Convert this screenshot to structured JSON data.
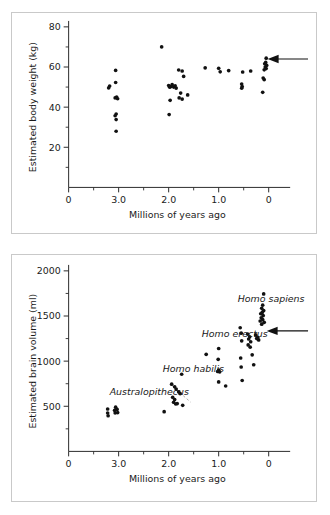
{
  "figure": {
    "background_color": "#ffffff",
    "panel_border_color": "#c9c9c9",
    "point_color": "#111111",
    "axis_color": "#2b2b2b"
  },
  "chart_data": [
    {
      "type": "scatter",
      "id": "body-weight",
      "title": "",
      "xlabel": "Millions of years ago",
      "ylabel": "Estimated body weight (kg)",
      "xlim": [
        4.0,
        -0.35
      ],
      "ylim": [
        0,
        80
      ],
      "x_ticks": [
        4.0,
        3.0,
        2.0,
        1.0,
        0
      ],
      "x_tick_labels": [
        "0",
        "3.0",
        "2.0",
        "1.0",
        "0"
      ],
      "x_minor_ticks": [
        3.5,
        2.5,
        1.5,
        0.5
      ],
      "y_ticks": [
        20,
        40,
        60,
        80
      ],
      "y_tick_labels": [
        "20",
        "40",
        "60",
        "80"
      ],
      "y_minor_ticks": [
        10,
        30,
        50,
        70
      ],
      "grid": false,
      "legend": "none",
      "annotations": [
        {
          "kind": "arrow",
          "label": "",
          "points_to_x": 0.02,
          "points_to_y": 64,
          "direction": "left"
        }
      ],
      "points": [
        {
          "x": 3.18,
          "y": 50.5
        },
        {
          "x": 3.2,
          "y": 49.6
        },
        {
          "x": 3.06,
          "y": 58.3
        },
        {
          "x": 3.06,
          "y": 52.3
        },
        {
          "x": 3.04,
          "y": 45.0
        },
        {
          "x": 3.02,
          "y": 44.2
        },
        {
          "x": 3.07,
          "y": 44.6
        },
        {
          "x": 3.05,
          "y": 36.6
        },
        {
          "x": 3.07,
          "y": 35.7
        },
        {
          "x": 3.05,
          "y": 33.8
        },
        {
          "x": 3.05,
          "y": 28.0
        },
        {
          "x": 2.14,
          "y": 70.0
        },
        {
          "x": 2.0,
          "y": 50.8
        },
        {
          "x": 1.98,
          "y": 49.9
        },
        {
          "x": 1.96,
          "y": 50.2
        },
        {
          "x": 1.93,
          "y": 51.2
        },
        {
          "x": 1.9,
          "y": 50.0
        },
        {
          "x": 1.87,
          "y": 50.6
        },
        {
          "x": 1.85,
          "y": 49.5
        },
        {
          "x": 1.97,
          "y": 43.4
        },
        {
          "x": 1.99,
          "y": 36.3
        },
        {
          "x": 1.8,
          "y": 58.5
        },
        {
          "x": 1.73,
          "y": 58.0
        },
        {
          "x": 1.7,
          "y": 55.3
        },
        {
          "x": 1.76,
          "y": 47.0
        },
        {
          "x": 1.79,
          "y": 44.6
        },
        {
          "x": 1.73,
          "y": 44.0
        },
        {
          "x": 1.62,
          "y": 46.1
        },
        {
          "x": 1.27,
          "y": 59.6
        },
        {
          "x": 1.0,
          "y": 59.4
        },
        {
          "x": 0.97,
          "y": 57.6
        },
        {
          "x": 0.8,
          "y": 58.2
        },
        {
          "x": 0.52,
          "y": 57.5
        },
        {
          "x": 0.36,
          "y": 58.0
        },
        {
          "x": 0.54,
          "y": 51.5
        },
        {
          "x": 0.53,
          "y": 50.3
        },
        {
          "x": 0.54,
          "y": 49.4
        },
        {
          "x": 0.05,
          "y": 64.4
        },
        {
          "x": 0.06,
          "y": 62.3
        },
        {
          "x": 0.08,
          "y": 61.6
        },
        {
          "x": 0.04,
          "y": 60.8
        },
        {
          "x": 0.07,
          "y": 60.0
        },
        {
          "x": 0.05,
          "y": 59.2
        },
        {
          "x": 0.09,
          "y": 58.6
        },
        {
          "x": 0.11,
          "y": 54.5
        },
        {
          "x": 0.09,
          "y": 53.7
        },
        {
          "x": 0.12,
          "y": 47.4
        }
      ]
    },
    {
      "type": "scatter",
      "id": "brain-volume",
      "title": "",
      "xlabel": "Millions of years ago",
      "ylabel": "Estimated brain volume (ml)",
      "xlim": [
        4.0,
        -0.35
      ],
      "ylim": [
        0,
        2000
      ],
      "x_ticks": [
        4.0,
        3.0,
        2.0,
        1.0,
        0
      ],
      "x_tick_labels": [
        "0",
        "3.0",
        "2.0",
        "1.0",
        "0"
      ],
      "x_minor_ticks": [
        3.5,
        2.5,
        1.5,
        0.5
      ],
      "y_ticks": [
        500,
        1000,
        1500,
        2000
      ],
      "y_tick_labels": [
        "500",
        "1000",
        "1500",
        "2000"
      ],
      "y_minor_ticks": [
        250,
        750,
        1250,
        1750
      ],
      "grid": false,
      "legend": "none",
      "species_labels": [
        {
          "text": "Australopithecus",
          "x": 3.18,
          "y": 620
        },
        {
          "text": "Homo habilis",
          "x": 2.12,
          "y": 880
        },
        {
          "text": "Homo erectus",
          "x": 1.34,
          "y": 1265
        },
        {
          "text": "Homo sapiens",
          "x": 0.62,
          "y": 1655
        }
      ],
      "annotations": [
        {
          "kind": "arrow",
          "label": "",
          "points_to_x": 0.04,
          "points_to_y": 1335,
          "direction": "left"
        },
        {
          "kind": "dashed-divider",
          "from_x": 1.92,
          "from_y": 720,
          "to_x": 1.56,
          "to_y": 545
        }
      ],
      "points": [
        {
          "x": 3.22,
          "y": 470
        },
        {
          "x": 3.22,
          "y": 425
        },
        {
          "x": 3.21,
          "y": 395
        },
        {
          "x": 3.06,
          "y": 490
        },
        {
          "x": 3.03,
          "y": 465
        },
        {
          "x": 3.08,
          "y": 455
        },
        {
          "x": 3.02,
          "y": 430
        },
        {
          "x": 3.07,
          "y": 425
        },
        {
          "x": 2.09,
          "y": 440
        },
        {
          "x": 1.94,
          "y": 745
        },
        {
          "x": 1.88,
          "y": 715
        },
        {
          "x": 1.85,
          "y": 690
        },
        {
          "x": 1.92,
          "y": 600
        },
        {
          "x": 1.88,
          "y": 575
        },
        {
          "x": 1.9,
          "y": 545
        },
        {
          "x": 1.86,
          "y": 525
        },
        {
          "x": 1.83,
          "y": 530
        },
        {
          "x": 1.8,
          "y": 660
        },
        {
          "x": 1.77,
          "y": 640
        },
        {
          "x": 1.74,
          "y": 855
        },
        {
          "x": 1.72,
          "y": 510
        },
        {
          "x": 1.25,
          "y": 1075
        },
        {
          "x": 1.0,
          "y": 1140
        },
        {
          "x": 1.01,
          "y": 1020
        },
        {
          "x": 1.0,
          "y": 900
        },
        {
          "x": 1.02,
          "y": 885
        },
        {
          "x": 0.98,
          "y": 880
        },
        {
          "x": 1.0,
          "y": 770
        },
        {
          "x": 0.86,
          "y": 725
        },
        {
          "x": 0.57,
          "y": 1370
        },
        {
          "x": 0.55,
          "y": 1310
        },
        {
          "x": 0.54,
          "y": 1225
        },
        {
          "x": 0.56,
          "y": 1035
        },
        {
          "x": 0.55,
          "y": 935
        },
        {
          "x": 0.53,
          "y": 785
        },
        {
          "x": 0.42,
          "y": 1300
        },
        {
          "x": 0.38,
          "y": 1270
        },
        {
          "x": 0.4,
          "y": 1245
        },
        {
          "x": 0.36,
          "y": 1215
        },
        {
          "x": 0.41,
          "y": 1180
        },
        {
          "x": 0.37,
          "y": 1155
        },
        {
          "x": 0.33,
          "y": 1070
        },
        {
          "x": 0.3,
          "y": 960
        },
        {
          "x": 0.26,
          "y": 1290
        },
        {
          "x": 0.22,
          "y": 1265
        },
        {
          "x": 0.24,
          "y": 1250
        },
        {
          "x": 0.2,
          "y": 1235
        },
        {
          "x": 0.1,
          "y": 1745
        },
        {
          "x": 0.12,
          "y": 1620
        },
        {
          "x": 0.14,
          "y": 1585
        },
        {
          "x": 0.1,
          "y": 1560
        },
        {
          "x": 0.13,
          "y": 1540
        },
        {
          "x": 0.16,
          "y": 1525
        },
        {
          "x": 0.11,
          "y": 1505
        },
        {
          "x": 0.15,
          "y": 1480
        },
        {
          "x": 0.12,
          "y": 1460
        },
        {
          "x": 0.17,
          "y": 1445
        },
        {
          "x": 0.09,
          "y": 1430
        },
        {
          "x": 0.14,
          "y": 1410
        }
      ]
    }
  ]
}
